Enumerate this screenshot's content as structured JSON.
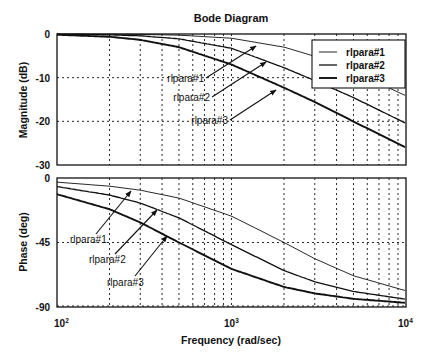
{
  "chart_data": [
    {
      "type": "line",
      "panel": "magnitude",
      "title": "Bode Diagram",
      "xlabel": "Frequency (rad/sec)",
      "ylabel": "Magnitude (dB)",
      "xscale": "log",
      "xlim": [
        100,
        10000
      ],
      "ylim": [
        -30,
        0
      ],
      "yticks": [
        "0",
        "-10",
        "-20",
        "-30"
      ],
      "grid": true,
      "legend_position": "upper right",
      "x": [
        100,
        200,
        300,
        500,
        1000,
        2000,
        3000,
        5000,
        10000
      ],
      "series": [
        {
          "name": "rlpara#1",
          "values": [
            -0.01,
            -0.04,
            -0.1,
            -0.26,
            -0.97,
            -3.01,
            -5.12,
            -8.6,
            -14.15
          ]
        },
        {
          "name": "rlpara#2",
          "values": [
            -0.05,
            -0.19,
            -0.42,
            -1.1,
            -3.27,
            -7.71,
            -10.66,
            -14.56,
            -20.46
          ]
        },
        {
          "name": "rlpara#3",
          "values": [
            -0.17,
            -0.64,
            -1.34,
            -3.01,
            -6.99,
            -12.3,
            -15.56,
            -20.04,
            -26.03
          ]
        }
      ],
      "annotations": [
        {
          "text": "rlpara#1",
          "arrow_to_series": "rlpara#1"
        },
        {
          "text": "rlpara#2",
          "arrow_to_series": "rlpara#2"
        },
        {
          "text": "rlpara#3",
          "arrow_to_series": "rlpara#3"
        }
      ]
    },
    {
      "type": "line",
      "panel": "phase",
      "xlabel": "Frequency (rad/sec)",
      "ylabel": "Phase (deg)",
      "xscale": "log",
      "xlim": [
        100,
        10000
      ],
      "ylim": [
        -90,
        0
      ],
      "xticks": [
        "10²",
        "10³",
        "10⁴"
      ],
      "yticks": [
        "0",
        "-45",
        "-90"
      ],
      "grid": true,
      "x": [
        100,
        200,
        300,
        500,
        1000,
        2000,
        3000,
        5000,
        10000
      ],
      "series": [
        {
          "name": "rlpara#1",
          "values": [
            -2.9,
            -5.7,
            -8.5,
            -14.0,
            -26.6,
            -45.0,
            -56.3,
            -68.2,
            -78.7
          ]
        },
        {
          "name": "rlpara#2",
          "values": [
            -6.0,
            -11.9,
            -17.5,
            -27.8,
            -46.5,
            -64.6,
            -72.4,
            -79.2,
            -84.6
          ]
        },
        {
          "name": "rlpara#3",
          "values": [
            -11.3,
            -21.8,
            -31.0,
            -45.0,
            -63.4,
            -76.0,
            -80.5,
            -84.3,
            -87.1
          ]
        }
      ],
      "annotations": [
        {
          "text": "rlpara#1",
          "arrow_to_series": "rlpara#1"
        },
        {
          "text": "rlpara#2",
          "arrow_to_series": "rlpara#2"
        },
        {
          "text": "rlpara#3",
          "arrow_to_series": "rlpara#3"
        }
      ]
    }
  ],
  "figure": {
    "title": "Bode Diagram",
    "xlabel": "Frequency (rad/sec)",
    "mag_ylabel": "Magnitude (dB)",
    "phase_ylabel": "Phase (deg)",
    "mag_yticks": [
      "0",
      "-10",
      "-20",
      "-30"
    ],
    "phase_yticks": [
      "0",
      "-45",
      "-90"
    ],
    "xticks": [
      {
        "base": "10",
        "exp": "2"
      },
      {
        "base": "10",
        "exp": "3"
      },
      {
        "base": "10",
        "exp": "4"
      }
    ],
    "legend": [
      "rlpara#1",
      "rlpara#2",
      "rlpara#3"
    ],
    "mag_annotations": [
      "rlpara#1",
      "rlpara#2",
      "rlpara#3"
    ],
    "phase_annotations": [
      "rlpara#1",
      "rlpara#2",
      "rlpara#3"
    ],
    "line_color": "#111111",
    "line_widths": [
      0.9,
      1.3,
      1.9
    ]
  }
}
